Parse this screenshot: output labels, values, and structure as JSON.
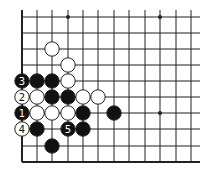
{
  "diagram": {
    "type": "go-board-fragment",
    "grid": {
      "columns_x": [
        22,
        37,
        52,
        68,
        83,
        98,
        114,
        129,
        145,
        160,
        176,
        191
      ],
      "rows_y": [
        17,
        33,
        49,
        65,
        81,
        97,
        113,
        129,
        146,
        162
      ],
      "right_extent": 200,
      "top_extent": 10,
      "left_edge_thick": true,
      "bottom_edge_thick": true,
      "line_color": "#222222"
    },
    "star_points": [
      {
        "col": 3,
        "row": 0
      },
      {
        "col": 9,
        "row": 0
      },
      {
        "col": 9,
        "row": 6
      }
    ],
    "stones": [
      {
        "color": "white",
        "col": 2,
        "row": 2,
        "label": ""
      },
      {
        "color": "white",
        "col": 3,
        "row": 3,
        "label": ""
      },
      {
        "color": "black",
        "col": 0,
        "row": 4,
        "label": "3"
      },
      {
        "color": "black",
        "col": 1,
        "row": 4,
        "label": ""
      },
      {
        "color": "black",
        "col": 2,
        "row": 4,
        "label": ""
      },
      {
        "color": "white",
        "col": 3,
        "row": 4,
        "label": ""
      },
      {
        "color": "white",
        "col": 0,
        "row": 5,
        "label": "2"
      },
      {
        "color": "white",
        "col": 1,
        "row": 5,
        "label": ""
      },
      {
        "color": "black",
        "col": 2,
        "row": 5,
        "label": ""
      },
      {
        "color": "black",
        "col": 3,
        "row": 5,
        "label": ""
      },
      {
        "color": "white",
        "col": 4,
        "row": 5,
        "label": ""
      },
      {
        "color": "white",
        "col": 5,
        "row": 5,
        "label": ""
      },
      {
        "color": "black",
        "col": 0,
        "row": 6,
        "label": "1"
      },
      {
        "color": "white",
        "col": 1,
        "row": 6,
        "label": ""
      },
      {
        "color": "white",
        "col": 2,
        "row": 6,
        "label": ""
      },
      {
        "color": "white",
        "col": 3,
        "row": 6,
        "label": ""
      },
      {
        "color": "black",
        "col": 4,
        "row": 6,
        "label": ""
      },
      {
        "color": "black",
        "col": 6,
        "row": 6,
        "label": ""
      },
      {
        "color": "white",
        "col": 0,
        "row": 7,
        "label": "4"
      },
      {
        "color": "black",
        "col": 1,
        "row": 7,
        "label": ""
      },
      {
        "color": "black",
        "col": 3,
        "row": 7,
        "label": "5"
      },
      {
        "color": "black",
        "col": 4,
        "row": 7,
        "label": ""
      },
      {
        "color": "black",
        "col": 2,
        "row": 8,
        "label": ""
      }
    ],
    "colors": {
      "black_stone": "#111111",
      "white_stone": "#ffffff",
      "stone_outline": "#222222"
    }
  }
}
